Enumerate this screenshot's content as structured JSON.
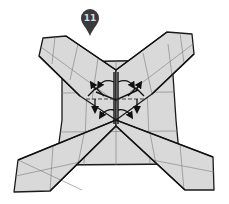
{
  "diagram": {
    "type": "origami-instruction-step",
    "step_marker": {
      "label": "11",
      "icon": "map-pin-icon",
      "color": "#3a3a3a"
    },
    "paper_color": "#d9d9d9",
    "line_color": "#1a1a1a",
    "parts": [
      {
        "name": "center-square"
      },
      {
        "name": "arm-top-left"
      },
      {
        "name": "arm-top-right"
      },
      {
        "name": "arm-bottom-left"
      },
      {
        "name": "arm-bottom-right"
      }
    ],
    "arrows": [
      {
        "name": "fold-arrow-top-left",
        "direction": "curved-left"
      },
      {
        "name": "fold-arrow-top-right",
        "direction": "curved-right"
      },
      {
        "name": "fold-arrow-bottom-left",
        "direction": "curved-left"
      },
      {
        "name": "fold-arrow-bottom-right",
        "direction": "curved-right"
      },
      {
        "name": "fold-arrow-down-left",
        "direction": "down"
      },
      {
        "name": "fold-arrow-down-right",
        "direction": "down"
      },
      {
        "name": "fold-arrow-corner-left",
        "direction": "up-left"
      },
      {
        "name": "fold-arrow-corner-right",
        "direction": "up-right"
      }
    ]
  }
}
